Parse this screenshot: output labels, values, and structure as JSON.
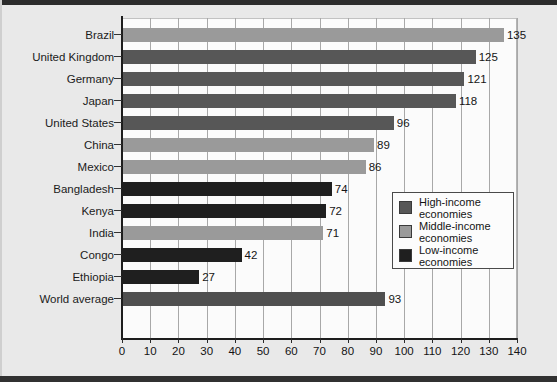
{
  "chart_data": {
    "type": "bar",
    "orientation": "horizontal",
    "title": "",
    "xlabel": "",
    "ylabel": "",
    "xlim": [
      0,
      140
    ],
    "xticks": [
      0,
      10,
      20,
      30,
      40,
      50,
      60,
      70,
      80,
      90,
      100,
      110,
      120,
      130,
      140
    ],
    "grid": true,
    "legend_position": "inner-right",
    "categories": [
      "Brazil",
      "United Kingdom",
      "Germany",
      "Japan",
      "United States",
      "China",
      "Mexico",
      "Bangladesh",
      "Kenya",
      "India",
      "Congo",
      "Ethiopia",
      "World average"
    ],
    "values": [
      135,
      125,
      121,
      118,
      96,
      89,
      86,
      74,
      72,
      71,
      42,
      27,
      93
    ],
    "groups": [
      "middle",
      "high",
      "high",
      "high",
      "high",
      "middle",
      "middle",
      "low",
      "low",
      "middle",
      "low",
      "low",
      "world"
    ],
    "bars": [
      {
        "label": "Brazil",
        "value": 135,
        "group": "middle"
      },
      {
        "label": "United Kingdom",
        "value": 125,
        "group": "high"
      },
      {
        "label": "Germany",
        "value": 121,
        "group": "high"
      },
      {
        "label": "Japan",
        "value": 118,
        "group": "high"
      },
      {
        "label": "United States",
        "value": 96,
        "group": "high"
      },
      {
        "label": "China",
        "value": 89,
        "group": "middle"
      },
      {
        "label": "Mexico",
        "value": 86,
        "group": "middle"
      },
      {
        "label": "Bangladesh",
        "value": 74,
        "group": "low"
      },
      {
        "label": "Kenya",
        "value": 72,
        "group": "low"
      },
      {
        "label": "India",
        "value": 71,
        "group": "middle"
      },
      {
        "label": "Congo",
        "value": 42,
        "group": "low"
      },
      {
        "label": "Ethiopia",
        "value": 27,
        "group": "low"
      },
      {
        "label": "World average",
        "value": 93,
        "group": "world"
      }
    ],
    "legend": [
      {
        "label": "High-income\neconomies",
        "group": "high",
        "color": "#575757"
      },
      {
        "label": "Middle-income\neconomies",
        "group": "middle",
        "color": "#9a9a9a"
      },
      {
        "label": "Low-income\neconomies",
        "group": "low",
        "color": "#1f1f1f"
      }
    ],
    "colors": {
      "high": "#575757",
      "middle": "#9a9a9a",
      "low": "#1f1f1f",
      "world": "#4f4f4f",
      "plot_background": "#fbfbfb",
      "page_background": "#e9e9e9",
      "gridline": "#a8a8a8",
      "axis": "#1d1d1d"
    }
  }
}
